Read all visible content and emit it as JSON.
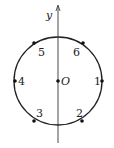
{
  "diagram": {
    "axis_label": "y",
    "origin_label": "O",
    "points": [
      {
        "label": "1",
        "angle_deg": 0
      },
      {
        "label": "2",
        "angle_deg": 300
      },
      {
        "label": "3",
        "angle_deg": 240
      },
      {
        "label": "4",
        "angle_deg": 180
      },
      {
        "label": "5",
        "angle_deg": 120
      },
      {
        "label": "6",
        "angle_deg": 60
      }
    ],
    "colors": {
      "stroke": "#222222",
      "background": "#ffffff"
    }
  }
}
